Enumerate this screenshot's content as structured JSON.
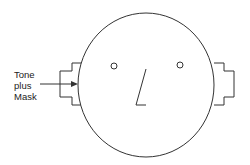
{
  "diagram": {
    "label_lines": [
      "Tone",
      "plus",
      "Mask"
    ],
    "stroke_color": "#333333",
    "background": "#ffffff"
  }
}
